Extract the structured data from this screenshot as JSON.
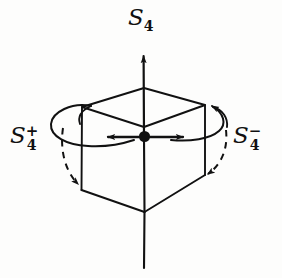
{
  "figure": {
    "background_color": "#fdfdfc",
    "ink_color": "#111111",
    "labels": {
      "axis_top": {
        "base": "S",
        "sub": "4",
        "sup": "",
        "full": "S4"
      },
      "rotation_left": {
        "base": "S",
        "sub": "4",
        "sup": "+",
        "full": "S4+"
      },
      "rotation_right": {
        "base": "S",
        "sub": "4",
        "sup": "−",
        "full": "S4-"
      }
    },
    "elements": {
      "cube": "wireframe-cube",
      "center_point": "center-dot",
      "vertical_axis": "s4-rotation-axis",
      "left_curved_arrow": "counterclockwise-rotation-arrow",
      "right_curved_arrow": "clockwise-rotation-arrow",
      "horizontal_arrows": "in-plane-reflection-arrows"
    },
    "geometry": {
      "center": [
        144,
        137
      ],
      "top_face": [
        [
          82,
          107
        ],
        [
          144,
          88
        ],
        [
          205,
          105
        ],
        [
          144,
          127
        ]
      ],
      "bottom_face_visible": [
        [
          82,
          190
        ],
        [
          144,
          212
        ],
        [
          205,
          175
        ]
      ],
      "axis_top_point": [
        144,
        50
      ],
      "axis_bottom_point": [
        144,
        268
      ],
      "left_arrow_tip": [
        101,
        137
      ],
      "right_arrow_tip": [
        190,
        137
      ]
    }
  }
}
